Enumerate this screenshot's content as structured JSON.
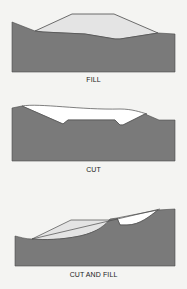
{
  "figure": {
    "panels": [
      {
        "id": "fill",
        "caption": "FILL"
      },
      {
        "id": "cut",
        "caption": "CUT"
      },
      {
        "id": "cut-and-fill",
        "caption": "CUT AND FILL"
      }
    ],
    "colors": {
      "ground": "#7a7a7a",
      "fill_material": "#e4e4e4",
      "cut_void": "#ffffff",
      "outline": "#4a4a4a",
      "background": "#f4f4f2"
    }
  }
}
